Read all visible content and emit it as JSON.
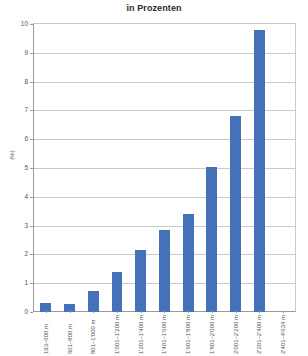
{
  "chart_data": {
    "type": "bar",
    "title": "in Prozenten",
    "xlabel": "",
    "ylabel": "(%)",
    "ylim": [
      0,
      10
    ],
    "ytick_labels": [
      "10",
      "9",
      "8",
      "7",
      "6",
      "5",
      "4",
      "3",
      "2",
      "1",
      "0"
    ],
    "grid": true,
    "legend": "none",
    "bar_color": "#4472b8",
    "categories": [
      "193–600 m",
      "601–800 m",
      "801–1'000 m",
      "1'001–1'200 m",
      "1'201–1'400 m",
      "1'401–1'600 m",
      "1'601–1'800 m",
      "1'801–2'000 m",
      "2'001–2'200 m",
      "2'201–2'400 m",
      "2'401–4'634 m"
    ],
    "values": [
      0.33,
      0.27,
      0.72,
      1.38,
      2.17,
      2.85,
      3.4,
      5.05,
      6.8,
      9.8,
      0
    ]
  }
}
